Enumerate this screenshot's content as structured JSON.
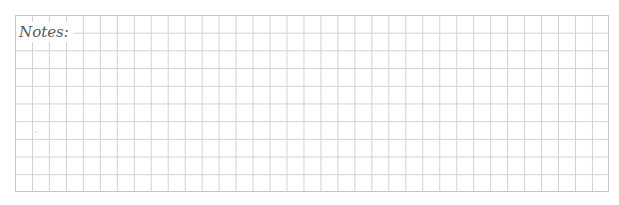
{
  "notes_section": {
    "label": "Notes:",
    "grid": {
      "columns": 35,
      "rows": 10,
      "line_color": "#d2d2d2",
      "border_color": "#c4c4c4",
      "background_color": "#ffffff"
    },
    "label_color": "#5a5a5a"
  }
}
